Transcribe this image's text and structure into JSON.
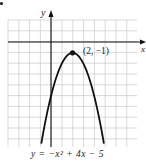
{
  "chart_data": {
    "type": "line",
    "title": "",
    "equation_label": "y = −x² + 4x − 5",
    "xlabel": "x",
    "ylabel": "y",
    "xlim": [
      -4,
      8
    ],
    "ylim": [
      -9.5,
      2
    ],
    "grid": true,
    "grid_step": 1,
    "series": [
      {
        "name": "y = -x^2 + 4x - 5",
        "function": "-x^2 + 4x - 5",
        "x": [
          -0.9,
          0,
          1,
          2,
          3,
          4,
          4.9
        ],
        "y": [
          -9.41,
          -5,
          -2,
          -1,
          -2,
          -5,
          -9.41
        ]
      }
    ],
    "annotations": [
      {
        "point": [
          2,
          -1
        ],
        "label": "(2, −1)",
        "marker": "filled-circle"
      }
    ]
  },
  "labels": {
    "y_axis": "y",
    "x_axis": "x",
    "vertex": "(2, −1)",
    "equation": "y = −x² + 4x − 5"
  },
  "style": {
    "grid_color": "#c8c8c8",
    "axis_color": "#111111",
    "curve_color": "#111111"
  }
}
